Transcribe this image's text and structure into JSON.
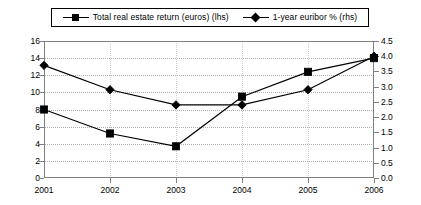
{
  "chart_data": {
    "type": "line",
    "title": "",
    "subtitle": "",
    "xlabel": "",
    "ylabel": "",
    "y2label": "",
    "categories": [
      "2001",
      "2002",
      "2003",
      "2004",
      "2005",
      "2006"
    ],
    "x": [
      2001,
      2002,
      2003,
      2004,
      2005,
      2006
    ],
    "series": [
      {
        "name": "Total real estate return (euros) (lhs)",
        "axis": "left",
        "marker": "square",
        "color": "#000000",
        "values": [
          8.0,
          5.2,
          3.7,
          9.5,
          12.4,
          14.0
        ]
      },
      {
        "name": "1-year euribor % (rhs)",
        "axis": "right",
        "marker": "diamond",
        "color": "#000000",
        "values": [
          3.7,
          2.9,
          2.4,
          2.4,
          2.9,
          4.0
        ]
      }
    ],
    "ylim": [
      0,
      16
    ],
    "yticks": [
      0,
      2,
      4,
      6,
      8,
      10,
      12,
      14,
      16
    ],
    "ytick_labels": [
      "0",
      "2",
      "4",
      "6",
      "8",
      "10",
      "12",
      "14",
      "16"
    ],
    "y2lim": [
      0.0,
      4.5
    ],
    "y2ticks": [
      0.0,
      0.5,
      1.0,
      1.5,
      2.0,
      2.5,
      3.0,
      3.5,
      4.0,
      4.5
    ],
    "y2tick_labels": [
      "0.0",
      "0.5",
      "1.0",
      "1.5",
      "2.0",
      "2.5",
      "3.0",
      "3.5",
      "4.0",
      "4.5"
    ],
    "grid": true,
    "grid_axis": "y",
    "legend_position": "top-center",
    "legend_border": true,
    "background": "#ffffff",
    "frame_color": "#808080",
    "gridline_color": "#b0b0b0"
  },
  "legend": {
    "entries": [
      {
        "label": "Total real estate return (euros) (lhs)",
        "marker": "square"
      },
      {
        "label": "1-year euribor % (rhs)",
        "marker": "diamond"
      }
    ]
  },
  "axes": {
    "left_ticks": [
      "16",
      "14",
      "12",
      "10",
      "8",
      "6",
      "4",
      "2",
      "0"
    ],
    "right_ticks": [
      "4.5",
      "4.0",
      "3.5",
      "3.0",
      "2.5",
      "2.0",
      "1.5",
      "1.0",
      "0.5",
      "0.0"
    ],
    "x_ticks": [
      "2001",
      "2002",
      "2003",
      "2004",
      "2005",
      "2006"
    ]
  }
}
